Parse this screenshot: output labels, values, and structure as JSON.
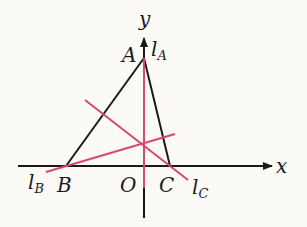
{
  "diagram": {
    "axes": {
      "x_label": "x",
      "y_label": "y",
      "origin_label": "O"
    },
    "vertices": {
      "A": "A",
      "B": "B",
      "C": "C"
    },
    "altitudes": {
      "lA": "l",
      "lA_sub": "A",
      "lB": "l",
      "lB_sub": "B",
      "lC": "l",
      "lC_sub": "C"
    },
    "colors": {
      "triangle": "#1a1a1a",
      "altitude": "#d44a6e",
      "axis": "#1a1a1a",
      "background": "#fbfaf7"
    }
  }
}
